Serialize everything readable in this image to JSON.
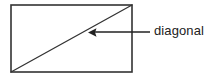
{
  "figure": {
    "type": "geometry-diagram",
    "title": "",
    "background_color": "#ffffff",
    "stroke_color": "#333333",
    "text_color": "#222222",
    "shape": {
      "name": "rectangle",
      "x": 11,
      "y": 5,
      "width": 121,
      "height": 67,
      "stroke_width": 1.6
    },
    "diagonal": {
      "name": "diagonal",
      "from_x": 11,
      "from_y": 72,
      "to_x": 132,
      "to_y": 5,
      "stroke_width": 1.3
    },
    "annotation": {
      "label": "diagonal",
      "leader_line": {
        "from_x": 150,
        "from_y": 32,
        "to_x": 88,
        "to_y": 32,
        "stroke_width": 1.3,
        "arrow_head": "left"
      },
      "label_x": 154,
      "label_y": 23,
      "font_size": 13
    }
  }
}
